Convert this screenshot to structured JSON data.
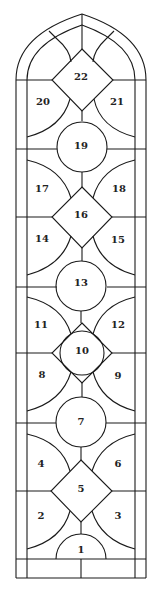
{
  "diagram": {
    "type": "stained-glass-window-panel-map",
    "colors": {
      "lead": "#1a1a1a",
      "background": "#ffffff",
      "label": "#222222"
    },
    "panels": [
      {
        "id": "1",
        "label": "1",
        "x": 81,
        "y": 550
      },
      {
        "id": "2",
        "label": "2",
        "x": 41,
        "y": 516
      },
      {
        "id": "3",
        "label": "3",
        "x": 118,
        "y": 516
      },
      {
        "id": "4",
        "label": "4",
        "x": 41,
        "y": 464
      },
      {
        "id": "5",
        "label": "5",
        "x": 81,
        "y": 489
      },
      {
        "id": "6",
        "label": "6",
        "x": 118,
        "y": 464
      },
      {
        "id": "7",
        "label": "7",
        "x": 81,
        "y": 422
      },
      {
        "id": "8",
        "label": "8",
        "x": 42,
        "y": 375
      },
      {
        "id": "9",
        "label": "9",
        "x": 118,
        "y": 376
      },
      {
        "id": "10",
        "label": "10",
        "x": 82,
        "y": 351
      },
      {
        "id": "11",
        "label": "11",
        "x": 41,
        "y": 325
      },
      {
        "id": "12",
        "label": "12",
        "x": 118,
        "y": 325
      },
      {
        "id": "13",
        "label": "13",
        "x": 81,
        "y": 283
      },
      {
        "id": "14",
        "label": "14",
        "x": 42,
        "y": 239
      },
      {
        "id": "15",
        "label": "15",
        "x": 118,
        "y": 240
      },
      {
        "id": "16",
        "label": "16",
        "x": 81,
        "y": 215
      },
      {
        "id": "17",
        "label": "17",
        "x": 42,
        "y": 189
      },
      {
        "id": "18",
        "label": "18",
        "x": 119,
        "y": 189
      },
      {
        "id": "19",
        "label": "19",
        "x": 81,
        "y": 146
      },
      {
        "id": "20",
        "label": "20",
        "x": 43,
        "y": 102
      },
      {
        "id": "21",
        "label": "21",
        "x": 117,
        "y": 102
      },
      {
        "id": "22",
        "label": "22",
        "x": 81,
        "y": 77
      }
    ]
  }
}
